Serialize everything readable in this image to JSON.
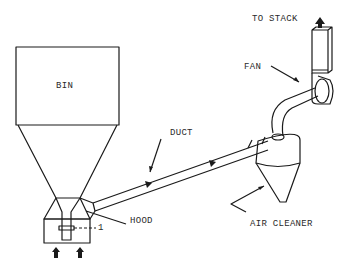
{
  "diagram": {
    "type": "industrial ventilation system schematic",
    "labels": {
      "to_stack": "TO STACK",
      "fan": "FAN",
      "bin": "BIN",
      "duct": "DUCT",
      "hood": "HOOD",
      "air_cleaner": "AIR CLEANER",
      "point_marker": "1"
    },
    "components": [
      "bin",
      "hood",
      "duct",
      "air-cleaner",
      "fan",
      "stack"
    ],
    "flow": [
      "hood",
      "duct",
      "air-cleaner",
      "fan",
      "stack"
    ],
    "colors": {
      "line": "#1a1a1a",
      "background": "#ffffff"
    }
  }
}
